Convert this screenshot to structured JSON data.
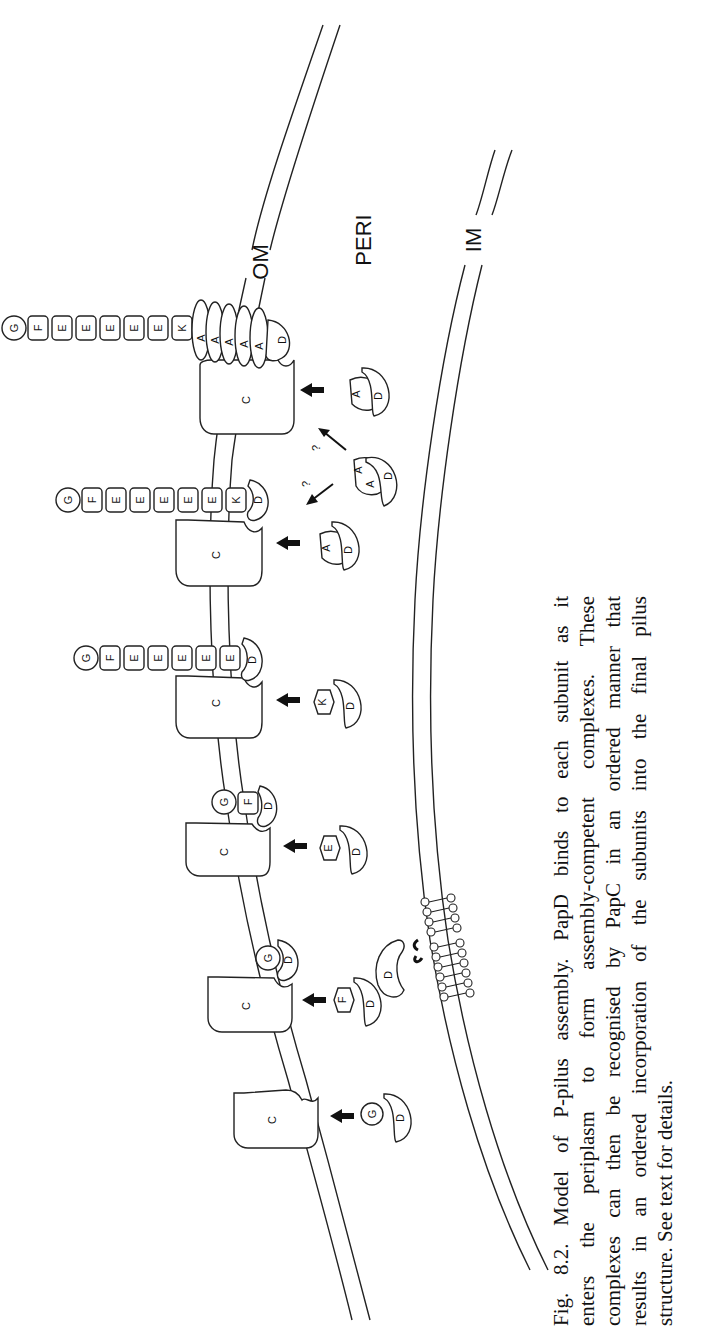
{
  "figure": {
    "labels": {
      "outer_membrane": "OM",
      "periplasm": "PERI",
      "inner_membrane": "IM",
      "usher": "C",
      "chaperone": "D",
      "question_mark": "?"
    },
    "assembly_stages": [
      {
        "stage": 1,
        "pilus_subunits": [],
        "incoming_complex": [
          "G",
          "D"
        ]
      },
      {
        "stage": 2,
        "pilus_subunits": [
          "G"
        ],
        "chaperone_bound": "D",
        "incoming_complex": [
          "F",
          "D"
        ]
      },
      {
        "stage": 3,
        "pilus_subunits": [
          "G",
          "F"
        ],
        "chaperone_bound": "D",
        "incoming_complex": [
          "E",
          "D"
        ]
      },
      {
        "stage": 4,
        "pilus_subunits": [
          "G",
          "F",
          "E",
          "E",
          "E",
          "E",
          "E"
        ],
        "chaperone_bound": "D",
        "incoming_complex": [
          "K",
          "D"
        ]
      },
      {
        "stage": 5,
        "pilus_subunits": [
          "G",
          "F",
          "E",
          "E",
          "E",
          "E",
          "E",
          "K"
        ],
        "chaperone_bound": "D",
        "incoming_complex": [
          "A",
          "D"
        ]
      },
      {
        "stage": 6,
        "pilus_subunits": [
          "G",
          "F",
          "E",
          "E",
          "E",
          "E",
          "E",
          "K",
          "A",
          "A",
          "A",
          "A",
          "A"
        ],
        "chaperone_bound": "D",
        "incoming_complex": [
          "A",
          "D"
        ]
      }
    ],
    "dimer_complex": [
      "A",
      "A",
      "D"
    ],
    "caption": {
      "lines": [
        "Fig. 8.2. Model of P-pilus assembly. PapD binds to each subunit as it",
        "enters the periplasm to form assembly-competent complexes. These",
        "complexes can then be recognised by PapC in an ordered manner that",
        "results in an ordered incorporation of the subunits into the final pilus",
        "structure. See text for details."
      ]
    }
  }
}
